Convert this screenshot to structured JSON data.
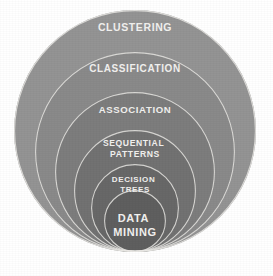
{
  "diagram": {
    "type": "nested-circles",
    "background_color": "#ffffff",
    "label_color": "#f2f1ef",
    "outline_color": "#e9e8e4",
    "canvas": {
      "width": 273,
      "height": 276
    },
    "rings": [
      {
        "id": "clustering",
        "label": "CLUSTERING",
        "level": 1,
        "fill": "#949494",
        "cx": 135,
        "cy": 131,
        "r": 121,
        "label_x": 135,
        "label_y": 28,
        "font_size": 10.5
      },
      {
        "id": "classification",
        "label": "CLASSIFICATION",
        "level": 2,
        "fill": "#8a8a8a",
        "cx": 135,
        "cy": 152,
        "r": 100,
        "label_x": 135,
        "label_y": 69,
        "font_size": 10
      },
      {
        "id": "association",
        "label": "ASSOCIATION",
        "level": 3,
        "fill": "#7d7d7d",
        "cx": 135,
        "cy": 172,
        "r": 80,
        "label_x": 135,
        "label_y": 110,
        "font_size": 9.6
      },
      {
        "id": "sequential-patterns",
        "label": "SEQUENTIAL PATTERNS",
        "label_lines": [
          "SEQUENTIAL",
          "PATTERNS"
        ],
        "level": 4,
        "fill": "#727272",
        "cx": 135,
        "cy": 191,
        "r": 61,
        "label_x": 135,
        "label_y": 144,
        "font_size": 8.6
      },
      {
        "id": "decision-trees",
        "label": "DECISION TREES",
        "label_lines": [
          "DECISION",
          "TREES"
        ],
        "level": 5,
        "fill": "#686868",
        "cx": 135,
        "cy": 208,
        "r": 44,
        "label_x": 135,
        "label_y": 180,
        "font_size": 8.0
      },
      {
        "id": "data-mining",
        "label": "DATA MINING",
        "label_lines": [
          "DATA",
          "MINING"
        ],
        "level": 6,
        "fill": "#5e5e5e",
        "cx": 135,
        "cy": 221,
        "r": 31,
        "label_x": 135,
        "label_y": 219,
        "font_size": 11.0
      }
    ]
  }
}
